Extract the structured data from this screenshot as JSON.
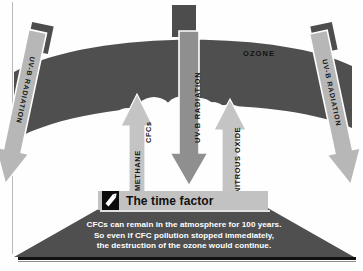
{
  "diagram": {
    "ozone_label": "OZONE",
    "radiation_arrows": [
      {
        "id": "uvb-left",
        "label": "UV-B RADIATION",
        "direction": "down",
        "color": "#b7b7b7"
      },
      {
        "id": "uvb-center",
        "label": "UV-B RADIATION",
        "direction": "down",
        "color": "#8f8f8f"
      },
      {
        "id": "uvb-right",
        "label": "UV-B RADIATION",
        "direction": "down",
        "color": "#b7b7b7"
      }
    ],
    "emission_arrows": [
      {
        "id": "up-ch4-left",
        "label": "METHANE",
        "direction": "up",
        "color": "#c4c4c4"
      },
      {
        "id": "up-ch4-right",
        "label": "CFCs",
        "direction": "up",
        "color": "#c4c4c4"
      },
      {
        "id": "up-n2o",
        "label": "NITROUS OXIDE",
        "direction": "up",
        "color": "#c4c4c4"
      }
    ],
    "banner": {
      "heading": "The time factor",
      "icon": "page-corner-icon"
    },
    "caption": {
      "line1": "CFCs can remain in the atmosphere for 100 years.",
      "line2": "So even if CFC pollution  stopped immediately,",
      "line3": "the destruction  of the ozone would continue."
    },
    "colors": {
      "ozone_band": "#4f4f4f",
      "hole": "#ffffff",
      "hill": "#4f4f4f",
      "banner": "#c2c2c2",
      "background": "#ffffff",
      "rule": "#111111"
    }
  }
}
